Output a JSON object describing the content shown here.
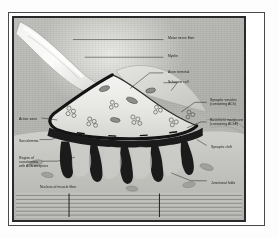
{
  "figure": {
    "style": "grayscale electron-micrograph style illustration",
    "frame_color": "#2a2a2a",
    "page_color": "#ffffff"
  },
  "labels": {
    "motor_nerve_fiber": "Motor nerve fiber",
    "myelin": "Myelin",
    "axon_terminal": "Axon terminal",
    "schwann_cell": "Schwann cell",
    "synaptic_vesicles": "Synaptic vesicles\n(containing ACh)",
    "basement_membrane": "Basement membrane\n(containing AChE)",
    "active_zone": "Active zone",
    "sarcolemma": "Sarcolemma",
    "sarcolemma_receptors": "Region of\nsarcolemma\nwith ACh receptors",
    "nucleus_muscle_fiber": "Nucleus of muscle fiber",
    "synaptic_cleft": "Synaptic cleft",
    "junctional_folds": "Junctional folds"
  },
  "structures": {
    "nerve_fiber": "myelinated motor nerve fiber entering from upper left",
    "terminal_dome": "axon terminal bouton containing synaptic vesicles and mitochondria",
    "folds_count": 5,
    "vesicle_clusters": 7,
    "mitochondria": 4,
    "striation_lines": 7,
    "z_lines": 2
  },
  "colors": {
    "ink": "#1d1d1d",
    "membrane_dark": "#1c1c1c",
    "cytoplasm_light": "#ebebe8",
    "field_mid": "#b5b5b1"
  }
}
